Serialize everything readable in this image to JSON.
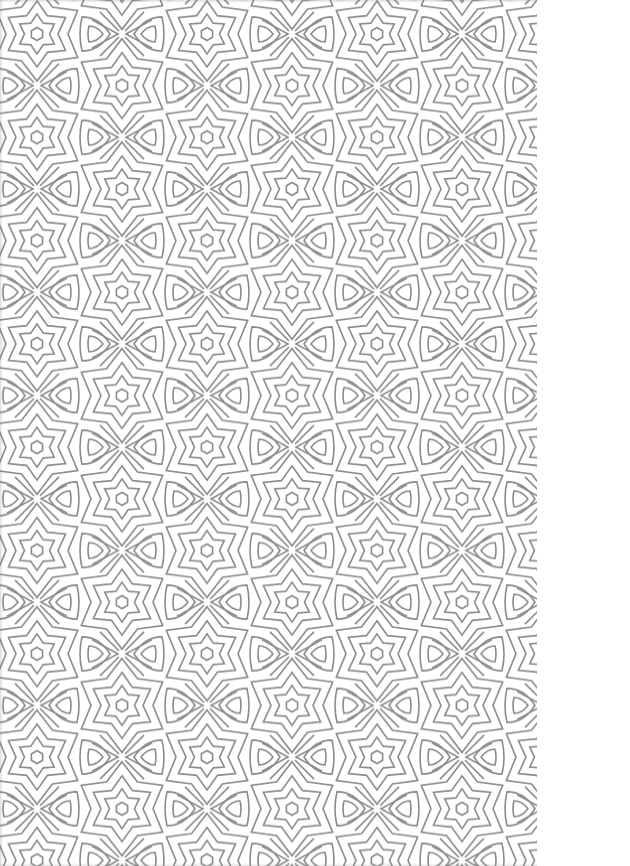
{
  "image": {
    "description": "Seamless geometric pattern of six-pointed stars and drop shapes",
    "pattern_width_px": 537,
    "background_color": "#ffffff",
    "stroke_color": "#8a8a8a",
    "stroke_width": 1.6
  },
  "pattern": {
    "tile_width": 170,
    "tile_height": 103.3,
    "origin_x": 37,
    "origin_y": 34,
    "motifs": [
      "six-point-star",
      "x-crossing",
      "drop"
    ]
  }
}
